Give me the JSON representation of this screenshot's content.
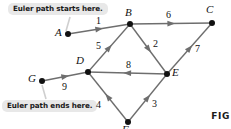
{
  "figure": {
    "caption_label": "FIG",
    "callouts": {
      "start": "Euler path starts here.",
      "end": "Euler path ends here."
    },
    "vertices": [
      {
        "id": "A",
        "label": "A",
        "x": 68,
        "y": 34,
        "label_x": 55,
        "label_y": 26
      },
      {
        "id": "B",
        "label": "B",
        "x": 130,
        "y": 24,
        "label_x": 125,
        "label_y": 6
      },
      {
        "id": "C",
        "label": "C",
        "x": 212,
        "y": 23,
        "label_x": 206,
        "label_y": 3
      },
      {
        "id": "D",
        "label": "D",
        "x": 88,
        "y": 72,
        "label_x": 76,
        "label_y": 54
      },
      {
        "id": "E",
        "label": "E",
        "x": 167,
        "y": 74,
        "label_x": 172,
        "label_y": 66
      },
      {
        "id": "F",
        "label": "F",
        "x": 128,
        "y": 122,
        "label_x": 122,
        "label_y": 123
      },
      {
        "id": "G",
        "label": "G",
        "x": 42,
        "y": 81,
        "label_x": 28,
        "label_y": 72
      }
    ],
    "edges": [
      {
        "number": "1",
        "from": "A",
        "to": "B",
        "label_x": 96,
        "label_y": 15
      },
      {
        "number": "2",
        "from": "B",
        "to": "E",
        "label_x": 153,
        "label_y": 38
      },
      {
        "number": "3",
        "from": "F",
        "to": "E",
        "label_x": 152,
        "label_y": 98
      },
      {
        "number": "4",
        "from": "F",
        "to": "D",
        "label_x": 96,
        "label_y": 99
      },
      {
        "number": "5",
        "from": "D",
        "to": "B",
        "label_x": 96,
        "label_y": 40
      },
      {
        "number": "6",
        "from": "B",
        "to": "C",
        "label_x": 166,
        "label_y": 9
      },
      {
        "number": "7",
        "from": "E",
        "to": "C",
        "label_x": 195,
        "label_y": 43
      },
      {
        "number": "8",
        "from": "E",
        "to": "D",
        "label_x": 126,
        "label_y": 59
      },
      {
        "number": "9",
        "from": "G",
        "to": "D",
        "label_x": 62,
        "label_y": 81
      }
    ],
    "colors": {
      "edge": "#6e6e6e",
      "vertex": "#111111",
      "callout_bg": "#e8e8e8",
      "text": "#111111"
    }
  }
}
